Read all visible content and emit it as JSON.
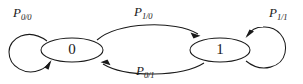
{
  "diagram": {
    "background_color": "#ffffff",
    "stroke_color": "#1a1a1a",
    "nodes": [
      {
        "id": "state0",
        "label": "0",
        "cx": 72,
        "cy": 50,
        "rx": 31,
        "ry": 12
      },
      {
        "id": "state1",
        "label": "1",
        "cx": 220,
        "cy": 50,
        "rx": 30,
        "ry": 12
      }
    ],
    "edges": [
      {
        "id": "self-loop-0",
        "base": "P",
        "subscript": "0/0",
        "from": "state0",
        "to": "state0",
        "kind": "self-loop",
        "side": "left"
      },
      {
        "id": "transition-0-to-1",
        "base": "P",
        "subscript": "1/0",
        "from": "state0",
        "to": "state1",
        "kind": "curve",
        "side": "top"
      },
      {
        "id": "transition-1-to-0",
        "base": "P",
        "subscript": "0/1",
        "from": "state1",
        "to": "state0",
        "kind": "curve",
        "side": "bottom"
      },
      {
        "id": "self-loop-1",
        "base": "P",
        "subscript": "1/1",
        "from": "state1",
        "to": "state1",
        "kind": "self-loop",
        "side": "right"
      }
    ]
  }
}
